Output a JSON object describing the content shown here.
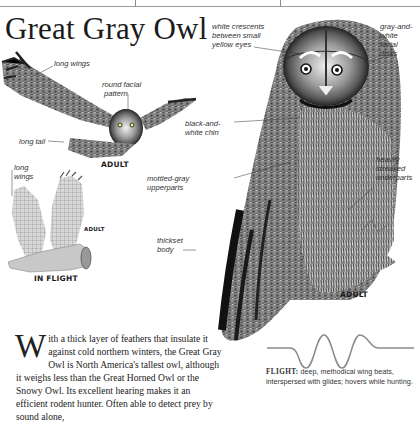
{
  "page": {
    "title": "Great Gray Owl",
    "accent_colors": {
      "ink": "#1b1b1b",
      "gray": "#8c8c8c",
      "eye": "#e9dc6a"
    }
  },
  "illustrations": {
    "flying_adult": {
      "caption": "ADULT",
      "callouts": [
        "long wings",
        "round facial pattern",
        "long tail"
      ]
    },
    "in_flight": {
      "caption": "IN FLIGHT",
      "sub_caption": "ADULT",
      "callouts": [
        "long wings"
      ]
    },
    "perched_adult": {
      "caption": "ADULT",
      "callouts": [
        "white crescents between small yellow eyes",
        "gray-and-white facial disks",
        "black-and-white chin",
        "mottled-gray upperparts",
        "heavily streaked underparts",
        "thickset body"
      ]
    }
  },
  "labels": {
    "long_wings_top": "long wings",
    "round_facial_1": "round facial",
    "round_facial_2": "pattern",
    "long_tail": "long tail",
    "adult_flying": "ADULT",
    "long_2a": "long",
    "long_2b": "wings",
    "adult_small": "ADULT",
    "in_flight": "IN FLIGHT",
    "white_cres_1": "white crescents",
    "white_cres_2": "between small",
    "white_cres_3": "yellow eyes",
    "gray_white_1": "gray-and-",
    "gray_white_2": "white",
    "gray_white_3": "facial",
    "gray_white_4": "disks",
    "chin_1": "black-and-",
    "chin_2": "white chin",
    "mottled_1": "mottled-gray",
    "mottled_2": "upperparts",
    "heavily_1": "heavily",
    "heavily_2": "streaked",
    "heavily_3": "underparts",
    "thickset_1": "thickset",
    "thickset_2": "body",
    "adult_perched": "ADULT"
  },
  "description": {
    "dropcap": "W",
    "text": "ith a thick layer of feathers that insulate it against cold northern winters, the Great Gray Owl is North America's tallest owl, although it weighs less than the Great Horned Owl or the Snowy Owl. Its excellent hearing makes it an efficient rodent hunter. Often able to detect prey by sound alone,"
  },
  "flight": {
    "label": "FLIGHT:",
    "text": " deep, methodical wing beats, interspersed with glides; hovers while hunting."
  }
}
